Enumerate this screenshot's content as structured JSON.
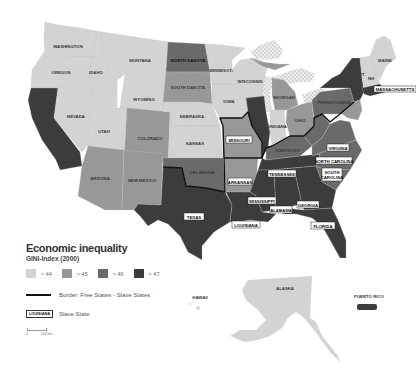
{
  "legend": {
    "title": "Economic inequality",
    "subtitle": "GINI-Index (2000)",
    "classes": [
      {
        "label": "< 44",
        "color": "#d3d3d3"
      },
      {
        "label": "> 45",
        "color": "#989898"
      },
      {
        "label": "> 46",
        "color": "#6a6a6a"
      },
      {
        "label": "> 47",
        "color": "#3c3c3c"
      }
    ],
    "border_label": "Border: Free States - Slave States",
    "slave_state_example": "LOUISIANA",
    "slave_state_label": "Slave State",
    "scale": {
      "zero": "0",
      "distance": "200 km"
    }
  },
  "colors": {
    "lt44": "#d3d3d3",
    "gt45": "#989898",
    "gt46": "#6a6a6a",
    "gt47": "#3c3c3c",
    "lakes_pattern": "#e6e6e6",
    "border": "#111111"
  },
  "states": {
    "washington": "WASHINGTON",
    "oregon": "OREGON",
    "idaho": "IDAHO",
    "montana": "MONTANA",
    "north_dakota": "NORTH DAKOTA",
    "south_dakota": "SOUTH DAKOTA",
    "minnesota": "MINNESOTA",
    "wisconsin": "WISCONSIN",
    "michigan": "MICHIGAN",
    "wyoming": "WYOMING",
    "nevada": "NEVADA",
    "utah": "UTAH",
    "colorado": "COLORADO",
    "nebraska": "NEBRASKA",
    "iowa": "IOWA",
    "kansas": "KANSAS",
    "arizona": "ARIZONA",
    "new_mexico": "NEW MEXICO",
    "oklahoma": "OKLAHOMA",
    "indiana": "INDIANA",
    "ohio": "OHIO",
    "pennsylvania": "PENNSYLVANIA",
    "kentucky": "KENTUCKY",
    "west_virginia": "WEST VIRGINIA",
    "maine": "MAINE",
    "vermont": "VT",
    "new_hampshire": "NH",
    "massachusetts": "MASSACHUSETTS",
    "missouri": "MISSOURI",
    "arkansas": "ARKANSAS",
    "tennessee": "TENNESSEE",
    "virginia": "VIRGINIA",
    "north_carolina": "NORTH CAROLINA",
    "south_carolina_1": "SOUTH",
    "south_carolina_2": "CAROLINA",
    "mississippi": "MISSISSIPPI",
    "alabama": "ALABAMA",
    "georgia": "GEORGIA",
    "texas": "TEXAS",
    "louisiana": "LOUISIANA",
    "florida": "FLORIDA",
    "hawaii": "HAWAII",
    "alaska": "ALASKA",
    "puerto_rico": "PUERTO RICO"
  }
}
